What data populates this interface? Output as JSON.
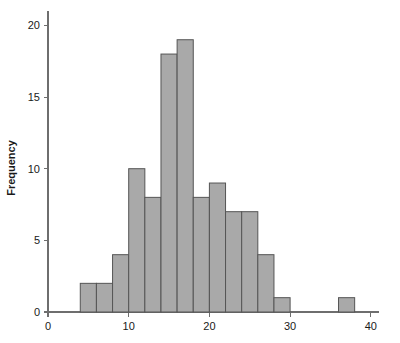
{
  "chart_data": {
    "type": "bar",
    "title": "",
    "subtitle": "",
    "xlabel": "",
    "ylabel": "Frequency",
    "grid": false,
    "legend": false,
    "legend_position": "none",
    "bin_width": 2,
    "categories": [
      "4-6",
      "6-8",
      "8-10",
      "10-12",
      "12-14",
      "14-16",
      "16-18",
      "18-20",
      "20-22",
      "22-24",
      "24-26",
      "26-28",
      "28-30",
      "30-32",
      "32-34",
      "34-36",
      "36-38",
      "38-40"
    ],
    "bin_starts": [
      4,
      6,
      8,
      10,
      12,
      14,
      16,
      18,
      20,
      22,
      24,
      26,
      28,
      30,
      32,
      34,
      36,
      38
    ],
    "values": [
      2,
      2,
      4,
      10,
      8,
      18,
      19,
      8,
      9,
      7,
      7,
      4,
      1,
      0,
      0,
      0,
      1,
      0
    ],
    "xlim": [
      0,
      41
    ],
    "ylim": [
      0,
      21
    ],
    "xticks": [
      0,
      10,
      20,
      30,
      40
    ],
    "xtick_labels": [
      "0",
      "10",
      "20",
      "30",
      "40"
    ],
    "yticks": [
      0,
      5,
      10,
      15,
      20
    ],
    "ytick_labels": [
      "0",
      "5",
      "10",
      "15",
      "20"
    ],
    "bar_fill": "#a9a9a9",
    "bar_stroke": "#555555",
    "axis_color": "#6e6e6e",
    "text_color": "#1a1a1a",
    "background": "#ffffff"
  },
  "axis": {
    "y_title": "Frequency",
    "x_title": ""
  }
}
